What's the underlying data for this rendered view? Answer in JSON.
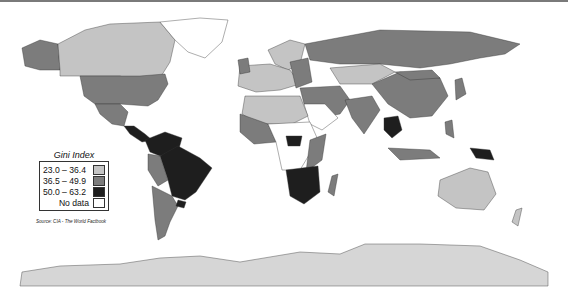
{
  "legend": {
    "title": "Gini Index",
    "items": [
      {
        "label": "23.0 – 36.4",
        "color": "#c4c4c4"
      },
      {
        "label": "36.5 – 49.9",
        "color": "#7c7c7c"
      },
      {
        "label": "50.0 – 63.2",
        "color": "#1e1e1e"
      },
      {
        "label": "No data",
        "color": "#ffffff"
      }
    ]
  },
  "source": "Source: CIA - The World Factbook"
}
